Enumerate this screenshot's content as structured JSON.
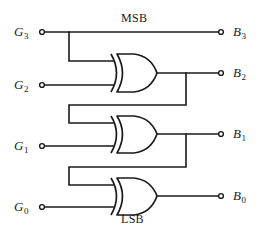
{
  "diagram": {
    "stroke_color": "#1a1a1a",
    "background_color": "#ffffff",
    "width": 266,
    "height": 241
  },
  "annotations": {
    "msb": "MSB",
    "lsb": "LSB"
  },
  "inputs": [
    {
      "id": "g3",
      "label": "G",
      "sub": "3",
      "x": 42,
      "y": 32
    },
    {
      "id": "g2",
      "label": "G",
      "sub": "2",
      "x": 42,
      "y": 85
    },
    {
      "id": "g1",
      "label": "G",
      "sub": "1",
      "x": 42,
      "y": 146
    },
    {
      "id": "g0",
      "label": "G",
      "sub": "0",
      "x": 42,
      "y": 207
    }
  ],
  "outputs": [
    {
      "id": "b3",
      "label": "B",
      "sub": "3",
      "x": 221,
      "y": 32
    },
    {
      "id": "b2",
      "label": "B",
      "sub": "2",
      "x": 221,
      "y": 74
    },
    {
      "id": "b1",
      "label": "B",
      "sub": "1",
      "x": 221,
      "y": 134
    },
    {
      "id": "b0",
      "label": "B",
      "sub": "0",
      "x": 221,
      "y": 196
    }
  ],
  "gates": [
    {
      "id": "xor1",
      "type": "XOR",
      "in_a": "G3",
      "in_b": "G2",
      "out": "B2",
      "cx": 112,
      "cy": 73
    },
    {
      "id": "xor2",
      "type": "XOR",
      "in_a": "B2",
      "in_b": "G1",
      "out": "B1",
      "cx": 112,
      "cy": 134
    },
    {
      "id": "xor3",
      "type": "XOR",
      "in_a": "B1",
      "in_b": "G0",
      "out": "B0",
      "cx": 112,
      "cy": 196
    }
  ],
  "equations": [
    "B3 = G3",
    "B2 = B3 XOR G2",
    "B1 = B2 XOR G1",
    "B0 = B1 XOR G0"
  ]
}
